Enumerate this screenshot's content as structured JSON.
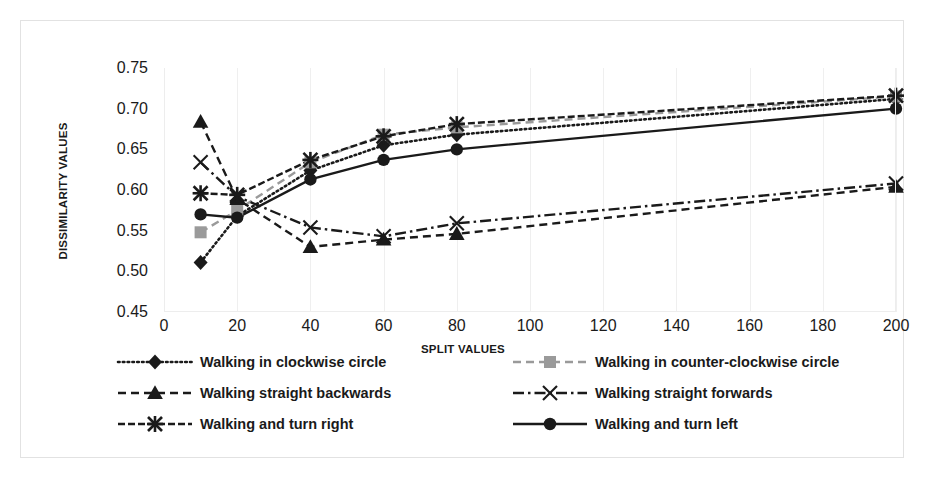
{
  "chart_data": {
    "type": "line",
    "title": "",
    "xlabel": "SPLIT VALUES",
    "ylabel": "DISSIMILARITY VALUES",
    "x": [
      10,
      20,
      40,
      60,
      80,
      200
    ],
    "xlim": [
      0,
      200
    ],
    "ylim": [
      0.45,
      0.75
    ],
    "xticks": [
      "0",
      "20",
      "40",
      "60",
      "80",
      "100",
      "120",
      "140",
      "160",
      "180",
      "200"
    ],
    "xtick_values": [
      0,
      20,
      40,
      60,
      80,
      100,
      120,
      140,
      160,
      180,
      200
    ],
    "yticks": [
      "0.45",
      "0.50",
      "0.55",
      "0.60",
      "0.65",
      "0.70",
      "0.75"
    ],
    "ytick_values": [
      0.45,
      0.5,
      0.55,
      0.6,
      0.65,
      0.7,
      0.75
    ],
    "grid": "vertical",
    "legend_position": "bottom",
    "series": [
      {
        "name": "Walking in clockwise circle",
        "marker": "diamond",
        "line": "dotted",
        "color": "#1a1a1a",
        "values": [
          0.511,
          0.568,
          0.624,
          0.655,
          0.668,
          0.712
        ]
      },
      {
        "name": "Walking in counter-clockwise circle",
        "marker": "square",
        "line": "dashed",
        "color": "#9a9a9a",
        "values": [
          0.548,
          0.575,
          0.634,
          0.668,
          0.677,
          0.715
        ]
      },
      {
        "name": "Walking straight backwards",
        "marker": "triangle",
        "line": "dashed",
        "color": "#1a1a1a",
        "values": [
          0.684,
          0.589,
          0.53,
          0.539,
          0.546,
          0.604
        ]
      },
      {
        "name": "Walking straight forwards",
        "marker": "x-thin",
        "line": "dash-dot",
        "color": "#1a1a1a",
        "values": [
          0.634,
          0.592,
          0.554,
          0.543,
          0.559,
          0.608
        ]
      },
      {
        "name": "Walking and turn right",
        "marker": "star",
        "line": "dashed-fine",
        "color": "#1a1a1a",
        "values": [
          0.596,
          0.594,
          0.637,
          0.666,
          0.681,
          0.716
        ]
      },
      {
        "name": "Walking and turn left",
        "marker": "circle",
        "line": "solid",
        "color": "#1a1a1a",
        "values": [
          0.57,
          0.566,
          0.613,
          0.637,
          0.65,
          0.7
        ]
      }
    ]
  }
}
